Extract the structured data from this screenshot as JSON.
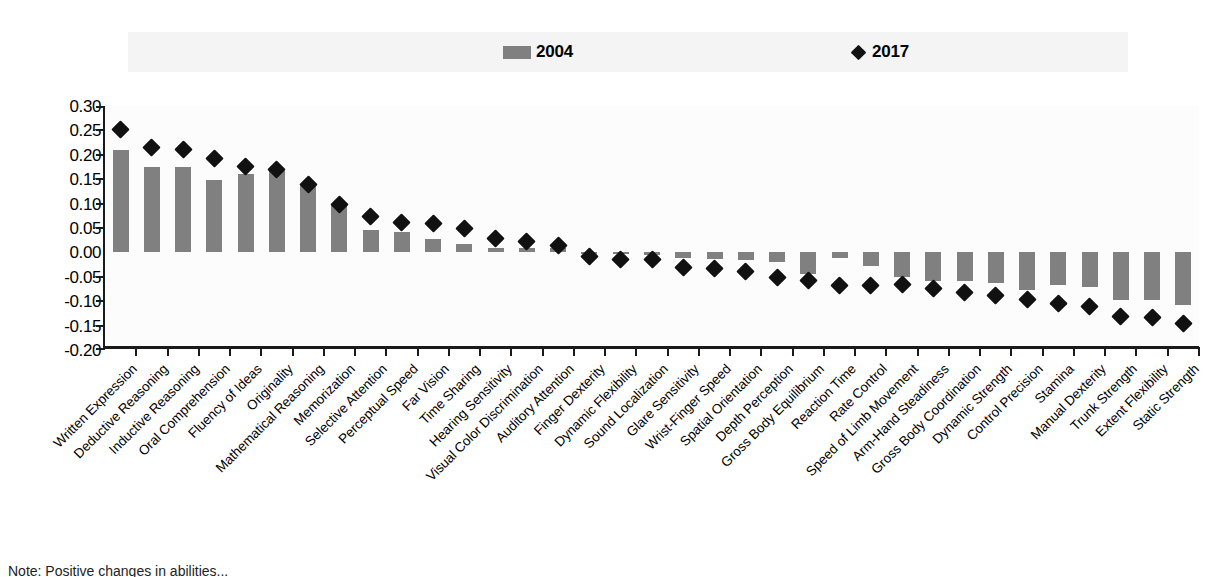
{
  "legend": {
    "series_2004_label": "2004",
    "series_2017_label": "2017",
    "swatch_2004_name": "bar-swatch",
    "swatch_2017_name": "diamond-marker"
  },
  "note": {
    "text": "Note: Positive changes in abilities..."
  },
  "colors": {
    "bar": "#808080",
    "marker": "#111111",
    "axis": "#1a1a1a",
    "legend_background": "#f4f4f4",
    "plot_background": "#fcfcfc"
  },
  "chart_data": {
    "type": "bar",
    "title": "",
    "subtitle": "",
    "xlabel": "",
    "ylabel": "",
    "ylim": [
      -0.2,
      0.3
    ],
    "ytick_labels": [
      "0.30",
      "0.25",
      "0.20",
      "0.15",
      "0.10",
      "0.05",
      "0.00",
      "-0.05",
      "-0.10",
      "-0.15",
      "-0.20"
    ],
    "ytick_values": [
      0.3,
      0.25,
      0.2,
      0.15,
      0.1,
      0.05,
      0.0,
      -0.05,
      -0.1,
      -0.15,
      -0.2
    ],
    "grid": false,
    "legend_position": "top",
    "categories": [
      "Written Expression",
      "Deductive Reasoning",
      "Inductive Reasoning",
      "Oral Comprehension",
      "Fluency of Ideas",
      "Originality",
      "Mathematical Reasoning",
      "Memorization",
      "Selective Attention",
      "Perceptual Speed",
      "Far Vision",
      "Time Sharing",
      "Hearing Sensitivity",
      "Visual Color Discrimination",
      "Auditory Attention",
      "Finger Dexterity",
      "Dynamic Flexibility",
      "Sound Localization",
      "Glare Sensitivity",
      "Wrist-Finger Speed",
      "Spatial Orientation",
      "Depth Perception",
      "Gross Body Equilibrium",
      "Reaction Time",
      "Rate Control",
      "Speed of Limb Movement",
      "Arm-Hand Steadiness",
      "Gross Body Coordination",
      "Dynamic Strength",
      "Control Precision",
      "Stamina",
      "Manual Dexterity",
      "Trunk Strength",
      "Extent Flexibility",
      "Static Strength"
    ],
    "series": [
      {
        "name": "2004",
        "type": "bar",
        "values": [
          0.21,
          0.175,
          0.175,
          0.148,
          0.16,
          0.167,
          0.138,
          0.098,
          0.045,
          0.042,
          0.028,
          0.018,
          0.01,
          0.008,
          0.008,
          -0.002,
          -0.004,
          -0.006,
          -0.012,
          -0.014,
          -0.016,
          -0.02,
          -0.044,
          -0.011,
          -0.028,
          -0.05,
          -0.058,
          -0.058,
          -0.062,
          -0.078,
          -0.066,
          -0.07,
          -0.098,
          -0.098,
          -0.108
        ]
      },
      {
        "name": "2017",
        "type": "scatter",
        "marker": "diamond",
        "values": [
          0.252,
          0.215,
          0.21,
          0.192,
          0.176,
          0.17,
          0.139,
          0.098,
          0.074,
          0.062,
          0.06,
          0.05,
          0.028,
          0.022,
          0.014,
          -0.008,
          -0.015,
          -0.014,
          -0.03,
          -0.032,
          -0.04,
          -0.052,
          -0.058,
          -0.068,
          -0.068,
          -0.066,
          -0.074,
          -0.082,
          -0.088,
          -0.096,
          -0.104,
          -0.11,
          -0.132,
          -0.134,
          -0.146
        ]
      }
    ]
  }
}
